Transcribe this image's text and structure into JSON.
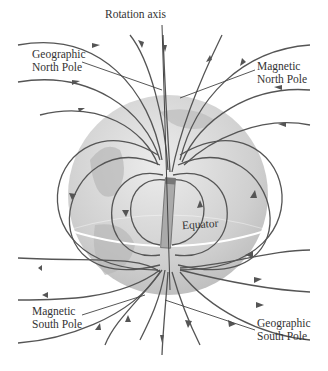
{
  "diagram": {
    "labels": {
      "rotation_axis": "Rotation axis",
      "geo_north_1": "Geographic",
      "geo_north_2": "North Pole",
      "mag_north_1": "Magnetic",
      "mag_north_2": "North Pole",
      "equator": "Equator",
      "mag_south_1": "Magnetic",
      "mag_south_2": "South Pole",
      "geo_south_1": "Geographic",
      "geo_south_2": "South Pole"
    },
    "colors": {
      "globe": "#cfcfcf",
      "globe_highlight": "#e6e6e6",
      "land": "#b5b5b5",
      "field_lines": "#555555",
      "equator_line": "#ffffff"
    }
  }
}
